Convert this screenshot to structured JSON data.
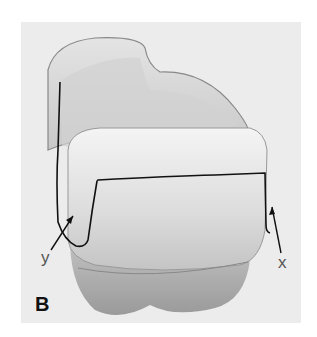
{
  "figure": {
    "panel_label": "B",
    "annotations": [
      {
        "label": "y",
        "side": "left"
      },
      {
        "label": "x",
        "side": "right"
      }
    ],
    "colors": {
      "background": "#ffffff",
      "panel": "#ececec",
      "outline": "#111111",
      "label": "#555555"
    }
  }
}
